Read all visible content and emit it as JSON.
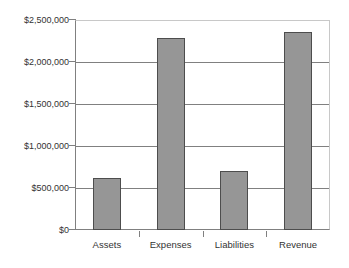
{
  "chart_data": {
    "type": "bar",
    "title": "",
    "subtitle": "",
    "xlabel": "",
    "ylabel": "",
    "categories": [
      "Assets",
      "Expenses",
      "Liabilities",
      "Revenue"
    ],
    "values": [
      620000,
      2280000,
      700000,
      2360000
    ],
    "series": [
      {
        "name": "Amount",
        "values": [
          620000,
          2280000,
          700000,
          2360000
        ]
      }
    ],
    "ylim": [
      0,
      2500000
    ],
    "ytick_values": [
      0,
      500000,
      1000000,
      1500000,
      2000000,
      2500000
    ],
    "ytick_labels": [
      "$0",
      "$500,000",
      "$1,000,000",
      "$1,500,000",
      "$2,000,000",
      "$2,500,000"
    ],
    "grid": true,
    "grid_axis": "y",
    "legend": false,
    "legend_position": "none",
    "bar_fill_color": "#969696",
    "bar_border_color": "#4d4d4d",
    "gridline_color": "#808080",
    "axis_color": "#808080",
    "plot_background": "#ffffff",
    "text_color": "#333333",
    "annotations": []
  }
}
